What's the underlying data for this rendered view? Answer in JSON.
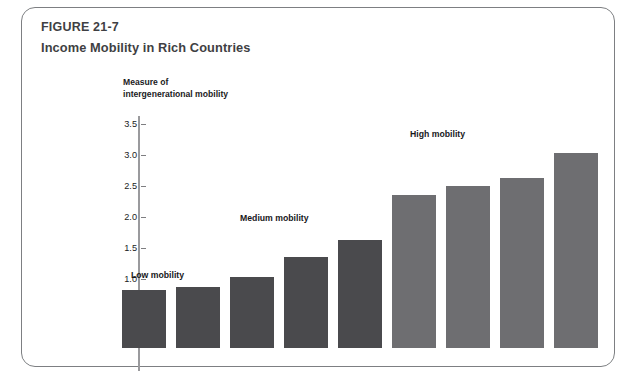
{
  "figure": {
    "number": "FIGURE 21-7",
    "title": "Income Mobility in Rich Countries"
  },
  "chart_data": {
    "type": "bar",
    "title": "Income Mobility in Rich Countries",
    "xlabel": "",
    "ylabel": "Measure of intergenerational mobility",
    "ylabel_lines": [
      "Measure of",
      "intergenerational mobility"
    ],
    "ylim": [
      0,
      3.5
    ],
    "ytick_labels": [
      "0.5",
      "1.0",
      "1.5",
      "2.0",
      "2.5",
      "3.0",
      "3.5"
    ],
    "ytick_values": [
      0.5,
      1.0,
      1.5,
      2.0,
      2.5,
      3.0,
      3.5
    ],
    "grid": false,
    "legend": "none",
    "categories": [
      "",
      "",
      "",
      "",
      "",
      "",
      "",
      "",
      ""
    ],
    "values": [
      0.93,
      0.99,
      1.15,
      1.46,
      1.74,
      2.47,
      2.61,
      2.75,
      3.14
    ],
    "bar_colors": [
      "#4a4a4d",
      "#4a4a4d",
      "#4a4a4d",
      "#4a4a4d",
      "#4a4a4d",
      "#6e6e71",
      "#6e6e71",
      "#6e6e71",
      "#6e6e71"
    ],
    "annotations": [
      {
        "text": "Low mobility",
        "x_px": 130,
        "y_px": 262
      },
      {
        "text": "Medium mobility",
        "x_px": 239,
        "y_px": 205
      },
      {
        "text": "High mobility",
        "x_px": 409,
        "y_px": 121
      }
    ]
  },
  "colors": {
    "bar_dark": "#4a4a4d",
    "bar_light": "#6e6e71",
    "axis": "#9a9a9d",
    "border": "#7d7f82",
    "text": "#3f3f43"
  }
}
